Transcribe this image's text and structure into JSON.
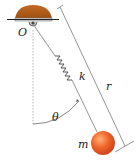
{
  "figure": {
    "type": "spring pendulum",
    "labels": {
      "pivot": "O",
      "spring_constant": "k",
      "length": "r",
      "angle": "θ",
      "mass": "m"
    },
    "colors": {
      "support": "#b8601c",
      "mass": "#ee6a2a",
      "rod": "#888888",
      "line": "#555555"
    }
  }
}
